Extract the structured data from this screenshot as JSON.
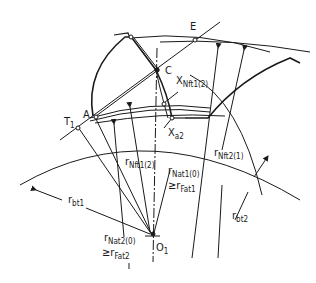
{
  "diagram": {
    "type": "gear-tooth-geometry",
    "colors": {
      "line": "#1a1a1a",
      "background": "#ffffff"
    },
    "points": {
      "E": "E",
      "C": "C",
      "A": "A",
      "T1": {
        "main": "T",
        "sub": "1"
      },
      "O1": {
        "main": "O",
        "sub": "1"
      },
      "X_Nft1_2": {
        "main": "X",
        "sub": "Nft1(2)"
      },
      "X_a2": {
        "main": "X",
        "sub": "a2"
      }
    },
    "radii": {
      "r_bt1": {
        "main": "r",
        "sub": "bt1"
      },
      "r_bt2": {
        "main": "r",
        "sub": "bt2"
      },
      "r_Nft1_2": {
        "main": "r",
        "sub": "Nft1(2)"
      },
      "r_Nft2_1": {
        "main": "r",
        "sub": "Nft2(1)"
      },
      "r_Nat1_0": {
        "main": "r",
        "sub": "Nat1(0)",
        "relation": "≥",
        "rel_main": "r",
        "rel_sub": "Fat1"
      },
      "r_Nat2_0": {
        "main": "r",
        "sub": "Nat2(0)",
        "relation": "≥",
        "rel_main": "r",
        "rel_sub": "Fat2"
      }
    }
  }
}
